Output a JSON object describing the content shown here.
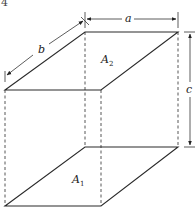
{
  "figure": {
    "number_label": "4",
    "dimension_labels": {
      "a": "a",
      "b": "b",
      "c": "c"
    },
    "faces": {
      "top": {
        "label": "A",
        "subscript": "2"
      },
      "bottom": {
        "label": "A",
        "subscript": "1"
      }
    }
  },
  "colors": {
    "line": "#2a2a2a",
    "background": "#ffffff"
  }
}
